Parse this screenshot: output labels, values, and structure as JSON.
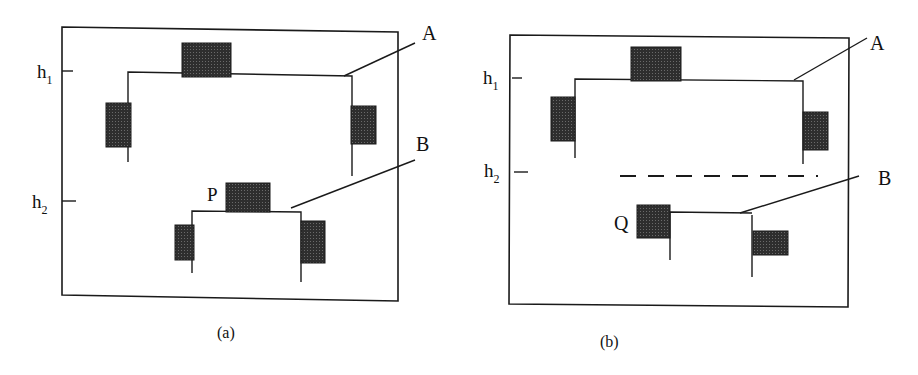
{
  "colors": {
    "ink": "#1a1a1a",
    "block": "#3a3a3a"
  },
  "panel_a": {
    "caption": "(a)",
    "level_labels": {
      "h1": "h",
      "h1_sub": "1",
      "h2": "h",
      "h2_sub": "2"
    },
    "structure_labels": {
      "upper": "A",
      "lower": "B"
    },
    "point_label": "P"
  },
  "panel_b": {
    "caption": "(b)",
    "level_labels": {
      "h1": "h",
      "h1_sub": "1",
      "h2": "h",
      "h2_sub": "2"
    },
    "structure_labels": {
      "upper": "A",
      "lower": "B"
    },
    "point_label": "Q"
  }
}
